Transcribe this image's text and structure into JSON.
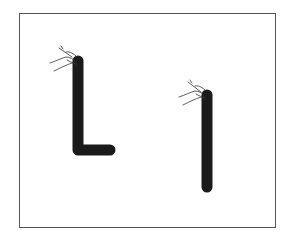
{
  "worksheet": {
    "type": "letter-tracing-practice",
    "letters": [
      {
        "glyph": "L",
        "description": "Thick black L stroke with hand holding pencil at start point"
      },
      {
        "glyph": "l",
        "description": "Thick black vertical stroke with hand holding pencil at start point"
      }
    ],
    "colors": {
      "stroke": "#1a1a1a",
      "frame": "#555555",
      "background": "#ffffff"
    }
  }
}
